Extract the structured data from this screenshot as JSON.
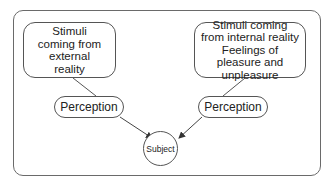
{
  "diagram": {
    "nodes": {
      "external_stimuli": "Stimuli coming from external reality",
      "internal_stimuli_line1": "Stimuli coming from internal reality",
      "internal_stimuli_line2": "Feelings of pleasure and unpleasure",
      "perception_left": "Perception",
      "perception_right": "Perception",
      "subject": "Subject"
    },
    "edges": [
      {
        "from": "external_stimuli",
        "to": "perception_left",
        "arrow": false
      },
      {
        "from": "internal_stimuli",
        "to": "perception_right",
        "arrow": false
      },
      {
        "from": "perception_left",
        "to": "subject",
        "arrow": true
      },
      {
        "from": "perception_right",
        "to": "subject",
        "arrow": true
      }
    ],
    "colors": {
      "stroke": "#555555",
      "background": "#ffffff"
    }
  }
}
